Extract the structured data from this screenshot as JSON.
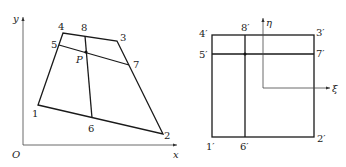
{
  "left_diagram": {
    "axes": {
      "origin": "O",
      "x": "x",
      "y": "y"
    },
    "nodes": {
      "n1": "1",
      "n2": "2",
      "n3": "3",
      "n4": "4",
      "n5": "5",
      "n6": "6",
      "n7": "7",
      "n8": "8",
      "p": "P"
    }
  },
  "right_diagram": {
    "axes": {
      "xi": "ξ",
      "eta": "η"
    },
    "nodes": {
      "n1": "1′",
      "n2": "2′",
      "n3": "3′",
      "n4": "4′",
      "n5": "5′",
      "n6": "6′",
      "n7": "7′",
      "n8": "8′"
    }
  },
  "colors": {
    "line": "#1a1a1a",
    "axis": "#444444",
    "background": "#ffffff"
  }
}
